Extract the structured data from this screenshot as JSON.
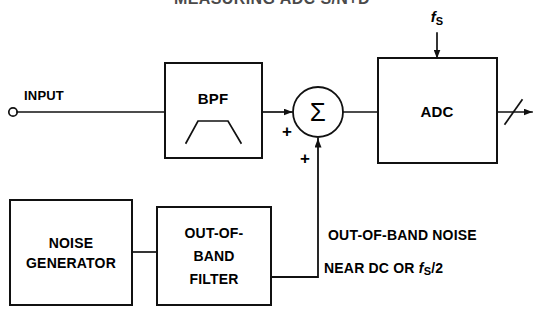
{
  "title": {
    "text": "MEASURING ADC S/N+D",
    "note": "cropped at top edge of screenshot"
  },
  "diagram": {
    "input": {
      "label": "INPUT",
      "terminal": "open-circle"
    },
    "blocks": [
      {
        "id": "bpf",
        "label": "BPF",
        "symbol": "bandpass-response-curve"
      },
      {
        "id": "adc",
        "label": "ADC"
      },
      {
        "id": "noise-generator",
        "label_line1": "NOISE",
        "label_line2": "GENERATOR"
      },
      {
        "id": "out-of-band-filter",
        "label_line1": "OUT-OF-",
        "label_line2": "BAND",
        "label_line3": "FILTER"
      }
    ],
    "summing_junction": {
      "symbol": "Σ",
      "sign_input_left": "+",
      "sign_input_bottom": "+"
    },
    "clock": {
      "label_base": "f",
      "label_sub": "S"
    },
    "output": {
      "bus_slash": true,
      "arrow": true
    },
    "annotations": {
      "line1": "OUT-OF-BAND NOISE",
      "line2_prefix": "NEAR DC OR ",
      "line2_f": "f",
      "line2_sub": "S",
      "line2_suffix": "/2"
    }
  },
  "colors": {
    "stroke": "#111111",
    "text": "#000000",
    "background": "#ffffff"
  }
}
